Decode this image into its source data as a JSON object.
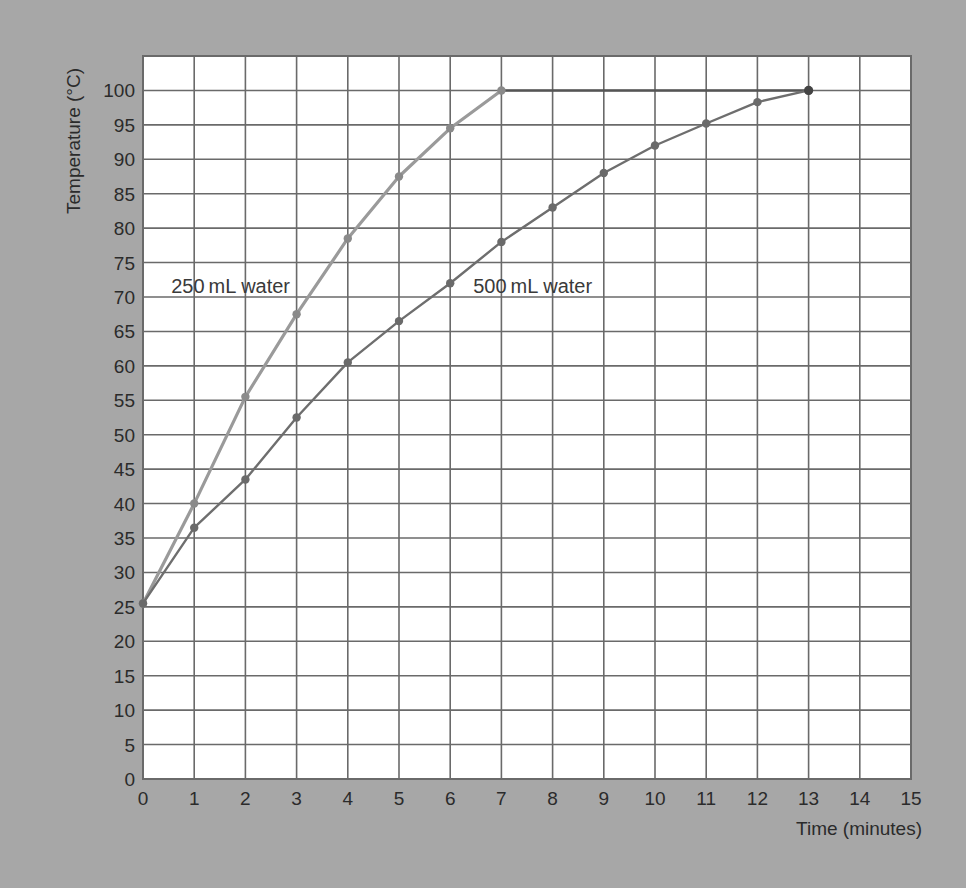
{
  "chart_data": {
    "type": "line",
    "title": "",
    "xlabel": "Time (minutes)",
    "ylabel": "Temperature (°C)",
    "xlim": [
      0,
      15
    ],
    "ylim": [
      0,
      105
    ],
    "x_ticks": [
      0,
      1,
      2,
      3,
      4,
      5,
      6,
      7,
      8,
      9,
      10,
      11,
      12,
      13,
      14,
      15
    ],
    "y_ticks": [
      0,
      5,
      10,
      15,
      20,
      25,
      30,
      35,
      40,
      45,
      50,
      55,
      60,
      65,
      70,
      75,
      80,
      85,
      90,
      95,
      100
    ],
    "grid": true,
    "legend": "inline labels",
    "series": [
      {
        "name": "250 mL water",
        "label": "250 mL water",
        "color": "#9a9a9a",
        "x": [
          0,
          1,
          2,
          3,
          4,
          5,
          6,
          7
        ],
        "values": [
          25.5,
          40,
          55.5,
          67.5,
          78.5,
          87.5,
          94.5,
          100
        ],
        "plateau": {
          "x": [
            7,
            13
          ],
          "value": 100,
          "color": "#555555"
        },
        "label_pos": {
          "x": 0.55,
          "y": 71.5
        }
      },
      {
        "name": "500 mL water",
        "label": "500 mL water",
        "color": "#6e6e6e",
        "x": [
          0,
          1,
          2,
          3,
          4,
          5,
          6,
          7,
          8,
          9,
          10,
          11,
          12,
          13
        ],
        "values": [
          25.5,
          36.5,
          43.5,
          52.5,
          60.5,
          66.5,
          72,
          78,
          83,
          88,
          92,
          95.2,
          98.3,
          100
        ],
        "label_pos": {
          "x": 6.45,
          "y": 71.5
        }
      }
    ]
  },
  "layout": {
    "plot_left": 143,
    "plot_right": 911,
    "plot_top": 56,
    "plot_bottom": 779,
    "background_color": "#a7a7a7",
    "plot_color": "#ffffff",
    "grid_color": "#6a6a6a",
    "text_color": "#2b2b2b"
  }
}
